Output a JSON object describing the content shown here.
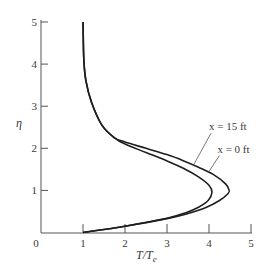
{
  "chart_data": {
    "type": "line",
    "title": "",
    "xlabel": "T/Te",
    "xlabel_main": "T/T",
    "xlabel_sub": "e",
    "ylabel": "η",
    "xlim": [
      0,
      5
    ],
    "ylim": [
      0,
      5
    ],
    "x_ticks": [
      0,
      1,
      2,
      3,
      4,
      5
    ],
    "y_ticks": [
      0,
      1,
      2,
      3,
      4,
      5
    ],
    "x_tick_labels": [
      "0",
      "1",
      "2",
      "3",
      "4",
      "5"
    ],
    "y_tick_labels": [
      "0",
      "1",
      "2",
      "3",
      "4",
      "5"
    ],
    "grid": false,
    "legend": "none (inline annotations)",
    "series": [
      {
        "name": "x = 0 ft",
        "points": [
          [
            1.0,
            0.0
          ],
          [
            2.0,
            0.15
          ],
          [
            3.0,
            0.33
          ],
          [
            3.5,
            0.45
          ],
          [
            3.9,
            0.58
          ],
          [
            4.25,
            0.76
          ],
          [
            4.45,
            0.92
          ],
          [
            4.48,
            1.0
          ],
          [
            4.4,
            1.15
          ],
          [
            4.1,
            1.38
          ],
          [
            3.75,
            1.55
          ],
          [
            3.4,
            1.7
          ],
          [
            3.0,
            1.85
          ],
          [
            2.5,
            2.0
          ],
          [
            2.0,
            2.15
          ],
          [
            1.75,
            2.25
          ],
          [
            1.45,
            2.55
          ],
          [
            1.2,
            3.1
          ],
          [
            1.07,
            3.6
          ],
          [
            1.02,
            4.1
          ],
          [
            1.0,
            5.0
          ]
        ]
      },
      {
        "name": "x = 15 ft",
        "points": [
          [
            1.0,
            0.0
          ],
          [
            2.0,
            0.15
          ],
          [
            3.0,
            0.34
          ],
          [
            3.45,
            0.47
          ],
          [
            3.75,
            0.6
          ],
          [
            3.98,
            0.76
          ],
          [
            4.07,
            0.95
          ],
          [
            4.0,
            1.12
          ],
          [
            3.75,
            1.32
          ],
          [
            3.4,
            1.52
          ],
          [
            3.0,
            1.7
          ],
          [
            2.5,
            1.9
          ],
          [
            2.0,
            2.1
          ],
          [
            1.75,
            2.25
          ],
          [
            1.45,
            2.55
          ],
          [
            1.2,
            3.1
          ],
          [
            1.07,
            3.6
          ],
          [
            1.02,
            4.1
          ],
          [
            1.0,
            5.0
          ]
        ]
      }
    ],
    "annotations": [
      {
        "text": "x = 15 ft",
        "label_xy": [
          4.0,
          2.43
        ],
        "arrow_to": [
          3.63,
          1.6
        ]
      },
      {
        "text": "x = 0 ft",
        "label_xy": [
          4.2,
          1.9
        ],
        "arrow_to": [
          4.0,
          1.45
        ]
      }
    ]
  }
}
